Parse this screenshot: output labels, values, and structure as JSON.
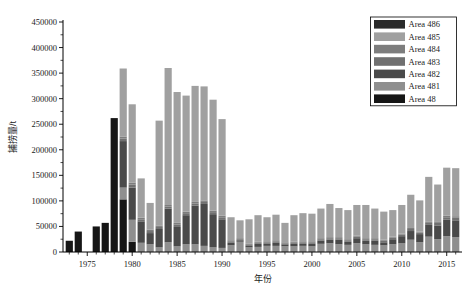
{
  "chart_data": {
    "type": "bar",
    "stacked": true,
    "title": "",
    "xlabel": "年份",
    "ylabel": "捕捞量/t",
    "xlim": [
      1972.3,
      2016.7
    ],
    "ylim": [
      0,
      450000
    ],
    "ytick_values": [
      0,
      50000,
      100000,
      150000,
      200000,
      250000,
      300000,
      350000,
      400000,
      450000
    ],
    "ytick_labels": [
      "0",
      "50000",
      "100000",
      "150000",
      "200000",
      "250000",
      "300000",
      "350000",
      "400000",
      "450000"
    ],
    "xtick_values": [
      1975,
      1980,
      1985,
      1990,
      1995,
      2000,
      2005,
      2010,
      2015
    ],
    "xtick_labels": [
      "1975",
      "1980",
      "1985",
      "1990",
      "1995",
      "2000",
      "2005",
      "2010",
      "2015"
    ],
    "grid": false,
    "legend_position": "top-right",
    "categories": [
      1973,
      1974,
      1975,
      1976,
      1977,
      1978,
      1979,
      1980,
      1981,
      1982,
      1983,
      1984,
      1985,
      1986,
      1987,
      1988,
      1989,
      1990,
      1991,
      1992,
      1993,
      1994,
      1995,
      1996,
      1997,
      1998,
      1999,
      2000,
      2001,
      2002,
      2003,
      2004,
      2005,
      2006,
      2007,
      2008,
      2009,
      2010,
      2011,
      2012,
      2013,
      2014,
      2015,
      2016
    ],
    "series": [
      {
        "name": "Area 48",
        "color": "#161616",
        "values": [
          22000,
          40000,
          0,
          50000,
          57000,
          262000,
          103000,
          20000,
          0,
          0,
          0,
          0,
          0,
          0,
          0,
          0,
          0,
          0,
          0,
          0,
          0,
          0,
          0,
          0,
          0,
          0,
          0,
          0,
          0,
          0,
          0,
          0,
          0,
          0,
          0,
          0,
          0,
          0,
          0,
          0,
          0,
          0,
          0,
          0
        ]
      },
      {
        "name": "Area 481",
        "color": "#8f8f8f",
        "values": [
          0,
          0,
          0,
          0,
          0,
          0,
          23000,
          43000,
          18000,
          15000,
          9000,
          19000,
          11000,
          15000,
          15000,
          12000,
          9000,
          8000,
          13000,
          20000,
          9000,
          10000,
          12000,
          12000,
          11000,
          11000,
          12000,
          11000,
          16000,
          17000,
          15000,
          14000,
          17000,
          15000,
          14000,
          13000,
          15000,
          17000,
          24000,
          19000,
          30000,
          25000,
          31000,
          29000
        ]
      },
      {
        "name": "Area 482",
        "color": "#4a4a4a",
        "values": [
          0,
          0,
          0,
          0,
          0,
          0,
          91000,
          63000,
          42000,
          22000,
          36000,
          66000,
          38000,
          57000,
          76000,
          82000,
          65000,
          56000,
          5000,
          3000,
          3000,
          6000,
          4000,
          6000,
          4000,
          5000,
          4000,
          5000,
          6000,
          7000,
          9000,
          6000,
          10000,
          7000,
          8000,
          6000,
          10000,
          14000,
          17000,
          16000,
          23000,
          27000,
          32000,
          33000
        ]
      },
      {
        "name": "Area 483",
        "color": "#707070",
        "values": [
          0,
          0,
          0,
          0,
          0,
          0,
          5000,
          6000,
          4000,
          4000,
          4000,
          4000,
          5000,
          4000,
          4000,
          4000,
          4000,
          4000,
          3000,
          2000,
          2000,
          2000,
          3000,
          3000,
          2000,
          2000,
          3000,
          3000,
          3000,
          3000,
          3000,
          3000,
          3000,
          3000,
          3000,
          3000,
          3000,
          3000,
          4000,
          3000,
          4000,
          5000,
          5000,
          5000
        ]
      },
      {
        "name": "Area 484",
        "color": "#7d7d7d",
        "values": [
          0,
          0,
          0,
          0,
          0,
          0,
          4000,
          4000,
          3000,
          3000,
          3000,
          3000,
          3000,
          3000,
          3000,
          3000,
          3000,
          3000,
          2000,
          2000,
          2000,
          2000,
          2000,
          2000,
          2000,
          2000,
          2000,
          2000,
          2000,
          2000,
          2000,
          2000,
          2000,
          2000,
          2000,
          2000,
          2000,
          2000,
          2000,
          2000,
          2000,
          3000,
          3000,
          3000
        ]
      },
      {
        "name": "Area 485",
        "color": "#a0a0a0",
        "values": [
          0,
          0,
          0,
          0,
          0,
          0,
          133000,
          153000,
          77000,
          52000,
          205000,
          268000,
          256000,
          227000,
          227000,
          223000,
          217000,
          189000,
          45000,
          35000,
          48000,
          52000,
          47000,
          50000,
          38000,
          52000,
          55000,
          54000,
          58000,
          65000,
          57000,
          57000,
          60000,
          65000,
          58000,
          55000,
          52000,
          56000,
          65000,
          61000,
          88000,
          72000,
          94000,
          94000
        ]
      },
      {
        "name": "Area 486",
        "color": "#2b2b2b",
        "values": [
          0,
          0,
          0,
          0,
          0,
          0,
          0,
          0,
          0,
          0,
          0,
          0,
          0,
          0,
          0,
          0,
          0,
          0,
          0,
          0,
          0,
          0,
          0,
          0,
          0,
          0,
          0,
          0,
          0,
          0,
          0,
          0,
          0,
          0,
          0,
          0,
          0,
          0,
          0,
          0,
          0,
          0,
          0,
          0
        ]
      }
    ]
  },
  "legend": {
    "items": [
      {
        "label": "Area 486",
        "color": "#2b2b2b"
      },
      {
        "label": "Area 485",
        "color": "#a0a0a0"
      },
      {
        "label": "Area 484",
        "color": "#7d7d7d"
      },
      {
        "label": "Area 483",
        "color": "#707070"
      },
      {
        "label": "Area 482",
        "color": "#4a4a4a"
      },
      {
        "label": "Area 481",
        "color": "#8f8f8f"
      },
      {
        "label": "Area 48",
        "color": "#161616"
      }
    ]
  },
  "axes": {
    "x_title": "年份",
    "y_title": "捕捞量/t"
  }
}
